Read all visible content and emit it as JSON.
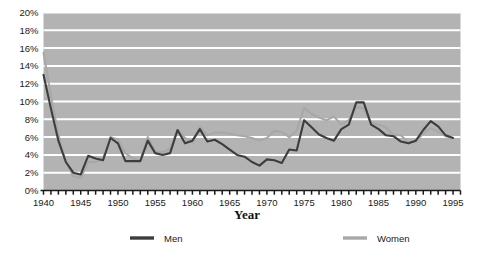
{
  "chart_data": {
    "type": "line",
    "title": "",
    "xlabel": "Year",
    "ylabel": "",
    "xlim": [
      1940,
      1996
    ],
    "ylim": [
      0,
      20
    ],
    "grid": true,
    "grid_axis": "y",
    "legend_position": "bottom",
    "plot_background": "#b3b3b3",
    "gridline_color": "#ffffff",
    "x": [
      1940,
      1941,
      1942,
      1943,
      1944,
      1945,
      1946,
      1947,
      1948,
      1949,
      1950,
      1951,
      1952,
      1953,
      1954,
      1955,
      1956,
      1957,
      1958,
      1959,
      1960,
      1961,
      1962,
      1963,
      1964,
      1965,
      1966,
      1967,
      1968,
      1969,
      1970,
      1971,
      1972,
      1973,
      1974,
      1975,
      1976,
      1977,
      1978,
      1979,
      1980,
      1981,
      1982,
      1983,
      1984,
      1985,
      1986,
      1987,
      1988,
      1989,
      1990,
      1991,
      1992,
      1993,
      1994,
      1995
    ],
    "xticks": [
      1940,
      1945,
      1950,
      1955,
      1960,
      1965,
      1970,
      1975,
      1980,
      1985,
      1990,
      1995
    ],
    "xtick_labels": [
      "1940",
      "1945",
      "1950",
      "1955",
      "1960",
      "1965",
      "1970",
      "1975",
      "1980",
      "1985",
      "1990",
      "1995"
    ],
    "xtick_minor_step": 1,
    "yticks": [
      0,
      2,
      4,
      6,
      8,
      10,
      12,
      14,
      16,
      18,
      20
    ],
    "ytick_labels": [
      "0%",
      "2%",
      "4%",
      "6%",
      "8%",
      "10%",
      "12%",
      "14%",
      "16%",
      "18%",
      "20%"
    ],
    "series": [
      {
        "name": "Men",
        "color": "#3d3d3d",
        "line_width": 2.1,
        "values": [
          13.0,
          9.2,
          5.6,
          3.2,
          2.0,
          1.8,
          3.9,
          3.6,
          3.4,
          5.9,
          5.3,
          3.3,
          3.3,
          3.3,
          5.6,
          4.2,
          4.0,
          4.2,
          6.8,
          5.3,
          5.6,
          6.9,
          5.5,
          5.7,
          5.2,
          4.6,
          4.0,
          3.8,
          3.2,
          2.8,
          3.5,
          3.4,
          3.1,
          4.6,
          4.5,
          7.9,
          7.1,
          6.3,
          5.9,
          5.6,
          6.9,
          7.4,
          9.9,
          9.9,
          7.4,
          6.9,
          6.2,
          6.1,
          5.5,
          5.3,
          5.6,
          6.8,
          7.8,
          7.2,
          6.2,
          5.9
        ],
        "marker": "none"
      },
      {
        "name": "Women",
        "color": "#a8a8a8",
        "line_width": 2.1,
        "values": [
          15.5,
          10.6,
          6.3,
          3.2,
          1.6,
          1.4,
          3.2,
          3.2,
          3.6,
          6.0,
          5.7,
          4.2,
          3.6,
          3.4,
          6.0,
          4.4,
          4.3,
          4.7,
          6.8,
          5.9,
          5.4,
          7.2,
          6.2,
          6.5,
          6.5,
          6.4,
          6.2,
          6.1,
          5.9,
          5.6,
          5.9,
          6.7,
          6.6,
          6.0,
          6.7,
          9.3,
          8.6,
          8.2,
          7.9,
          8.3,
          7.4,
          7.9,
          9.4,
          9.2,
          7.6,
          7.4,
          7.1,
          6.2,
          6.2,
          5.4,
          5.5,
          6.4,
          7.0,
          6.6,
          6.1,
          5.9
        ],
        "marker": "none"
      }
    ]
  },
  "legend": {
    "items": [
      {
        "label": "Men",
        "color": "#3d3d3d"
      },
      {
        "label": "Women",
        "color": "#a8a8a8"
      }
    ]
  },
  "axis_titles": {
    "x": "Year"
  }
}
